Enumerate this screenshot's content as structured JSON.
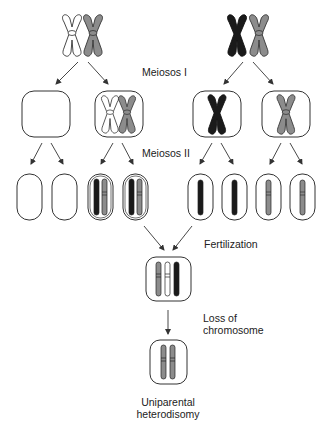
{
  "colors": {
    "white_chromosome": "#ffffff",
    "grey_chromosome": "#8c8c8c",
    "black_chromosome": "#1a1a1a",
    "outline": "#333333",
    "background": "#ffffff"
  },
  "labels": {
    "meiosis1": "Meiosos I",
    "meiosis2": "Meiosos II",
    "fertilization": "Fertilization",
    "loss_line1": "Loss of",
    "loss_line2": "chromosome",
    "result_line1": "Uniparental",
    "result_line2": "heterodisomy"
  },
  "stages": {
    "parents": [
      {
        "name": "parent-1",
        "chromosomes": [
          "white",
          "grey"
        ]
      },
      {
        "name": "parent-2",
        "chromosomes": [
          "black",
          "grey"
        ]
      }
    ],
    "meiosis1_cells": [
      {
        "name": "cell-1",
        "chromosomes": []
      },
      {
        "name": "cell-2",
        "chromosomes": [
          "white",
          "grey"
        ]
      },
      {
        "name": "cell-3",
        "chromosomes": [
          "black"
        ]
      },
      {
        "name": "cell-4",
        "chromosomes": [
          "grey"
        ]
      }
    ],
    "meiosis2_gametes": [
      {
        "name": "gamete-1",
        "chromatids": []
      },
      {
        "name": "gamete-2",
        "chromatids": []
      },
      {
        "name": "gamete-3",
        "chromatids": [
          "black",
          "grey"
        ]
      },
      {
        "name": "gamete-4",
        "chromatids": [
          "black",
          "grey"
        ]
      },
      {
        "name": "gamete-5",
        "chromatids": [
          "black"
        ]
      },
      {
        "name": "gamete-6",
        "chromatids": [
          "black"
        ]
      },
      {
        "name": "gamete-7",
        "chromatids": [
          "grey"
        ]
      },
      {
        "name": "gamete-8",
        "chromatids": [
          "grey"
        ]
      }
    ],
    "zygote": {
      "chromatids": [
        "grey",
        "white",
        "black"
      ]
    },
    "final": {
      "chromatids": [
        "grey",
        "grey"
      ]
    }
  }
}
